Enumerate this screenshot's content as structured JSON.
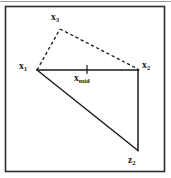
{
  "figure": {
    "kind": "geometry-diagram",
    "background_color": "#ffffff",
    "frame": {
      "border_color": "#2b2b2b",
      "top_rule_color": "#9a9a9a",
      "x": 5,
      "y": 6,
      "width": 160,
      "height": 166
    },
    "stroke_color": "#1a1a1a",
    "labels": [
      {
        "id": "x3",
        "base": "x",
        "sub": "3",
        "text": "x3"
      },
      {
        "id": "x1",
        "base": "x",
        "sub": "1",
        "text": "x1"
      },
      {
        "id": "x2",
        "base": "x",
        "sub": "2",
        "text": "x2"
      },
      {
        "id": "xmid",
        "base": "x",
        "sub": "mid",
        "text": "xmid"
      },
      {
        "id": "z2",
        "base": "z",
        "sub": "2",
        "text": "z2"
      }
    ],
    "points": {
      "x1": {
        "x": 37,
        "y": 70
      },
      "x2": {
        "x": 138,
        "y": 70
      },
      "x3": {
        "x": 60,
        "y": 29
      },
      "xmid": {
        "x": 87,
        "y": 70
      },
      "z2": {
        "x": 138,
        "y": 150
      }
    },
    "edges": [
      {
        "from": "x1",
        "to": "x2",
        "style": "solid",
        "name": "segment-x1-x2"
      },
      {
        "from": "x2",
        "to": "z2",
        "style": "solid",
        "name": "segment-x2-z2"
      },
      {
        "from": "x1",
        "to": "z2",
        "style": "solid",
        "name": "segment-x1-z2"
      },
      {
        "from": "x1",
        "to": "x3",
        "style": "dashed",
        "name": "segment-x1-x3"
      },
      {
        "from": "x3",
        "to": "x2",
        "style": "dashed",
        "name": "segment-x3-x2"
      }
    ],
    "tick": {
      "x": 87,
      "y_top": 65,
      "y_bottom": 74,
      "name": "midpoint-tick"
    }
  }
}
